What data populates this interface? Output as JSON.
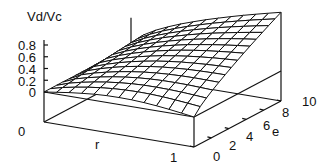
{
  "chart_data": {
    "type": "surface3d",
    "title": "",
    "zlabel": "Vd/Vc",
    "xlabel": "r",
    "ylabel": "e",
    "x_range": [
      0,
      1
    ],
    "y_range": [
      0,
      10
    ],
    "z_range": [
      0,
      0.8
    ],
    "z_ticks": [
      "0.8",
      "0.6",
      "0.4",
      "0.2",
      "0"
    ],
    "x_ticks": [
      "0",
      "1"
    ],
    "y_ticks": [
      "0",
      "2",
      "4",
      "6",
      "8",
      "10"
    ],
    "grid": false,
    "legend": null,
    "sample_surface": {
      "r": [
        0,
        0.25,
        0.5,
        0.75,
        1.0
      ],
      "e": [
        0,
        5,
        10
      ],
      "values": [
        [
          0,
          0,
          0
        ],
        [
          0.08,
          0.28,
          0.5
        ],
        [
          0.12,
          0.4,
          0.69
        ],
        [
          0.08,
          0.47,
          0.84
        ],
        [
          0.0,
          0.5,
          1.0
        ]
      ]
    }
  },
  "labels": {
    "z_axis_title": "Vd/Vc",
    "z_tick_0_8": "0.8",
    "z_tick_0_6": "0.6",
    "z_tick_0_4": "0.4",
    "z_tick_0_2": "0.2",
    "z_tick_0": "0",
    "floor_zero": "0",
    "r_axis_title": "r",
    "r_tick_1": "1",
    "e_axis_title": "e",
    "e_tick_0": "0",
    "e_tick_2": "2",
    "e_tick_4": "4",
    "e_tick_6": "6",
    "e_tick_8": "8",
    "e_tick_10": "10"
  }
}
